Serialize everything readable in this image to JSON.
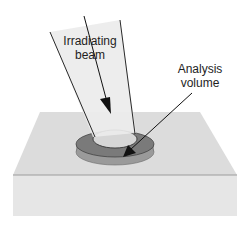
{
  "diagram": {
    "labels": {
      "beam_line1": "Irradiating",
      "beam_line2": "beam",
      "analysis_line1": "Analysis",
      "analysis_line2": "volume"
    },
    "colors": {
      "background": "#ffffff",
      "beam_fill": "#e8e8e8",
      "beam_edge": "#2a2a2a",
      "sample_top": "#dcdcdc",
      "sample_front": "#e6e6e6",
      "sample_edge": "#8a8a8a",
      "ring_top": "#7a7a7a",
      "ring_side": "#9a9a9a",
      "spot_fill": "#d6d6d6",
      "arrow": "#111111"
    }
  }
}
